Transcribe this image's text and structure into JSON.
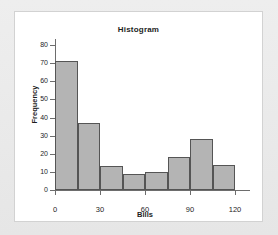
{
  "chart_data": {
    "type": "bar",
    "title": "Histogram",
    "xlabel": "Bills",
    "ylabel": "Frequency",
    "categories": [
      "0-15",
      "15-30",
      "30-45",
      "45-60",
      "60-75",
      "75-90",
      "90-105",
      "105-120"
    ],
    "bin_edges": [
      0,
      15,
      30,
      45,
      60,
      75,
      90,
      105,
      120
    ],
    "values": [
      71,
      37,
      13,
      9,
      10,
      18,
      28,
      14
    ],
    "xlim": [
      0,
      120
    ],
    "ylim": [
      0,
      80
    ],
    "xticks": [
      0,
      30,
      60,
      90,
      120
    ],
    "yticks": [
      0,
      10,
      20,
      30,
      40,
      50,
      60,
      70,
      80
    ],
    "xtick_labels": [
      "0",
      "30",
      "60",
      "90",
      "120"
    ],
    "ytick_labels": [
      "0",
      "10",
      "20",
      "30",
      "40",
      "50",
      "60",
      "70",
      "80"
    ],
    "grid": false,
    "legend": null,
    "bar_fill_color": "#b4b4b4",
    "bar_edge_color": "#555555",
    "axis_color": "#6d6d6d",
    "panel_color": "#ffffff",
    "page_background_color": "#e9e9e9"
  }
}
